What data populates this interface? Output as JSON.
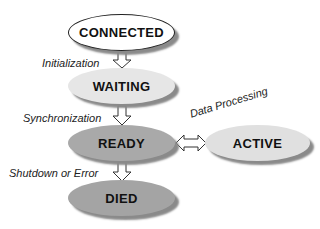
{
  "diagram": {
    "nodes": [
      {
        "id": "connected",
        "label": "CONNECTED",
        "fill": "#ffffff"
      },
      {
        "id": "waiting",
        "label": "WAITING",
        "fill": "#e6e6e6"
      },
      {
        "id": "ready",
        "label": "READY",
        "fill": "#a9a9a9"
      },
      {
        "id": "active",
        "label": "ACTIVE",
        "fill": "#e0e0e0"
      },
      {
        "id": "died",
        "label": "DIED",
        "fill": "#a4a4a4"
      }
    ],
    "edges": [
      {
        "from": "connected",
        "to": "waiting",
        "label": "Initialization"
      },
      {
        "from": "waiting",
        "to": "ready",
        "label": "Synchronization"
      },
      {
        "from": "ready",
        "to": "died",
        "label": "Shutdown or Error"
      },
      {
        "from": "ready",
        "to": "active",
        "label": "Data Processing",
        "bidirectional": true
      }
    ]
  }
}
